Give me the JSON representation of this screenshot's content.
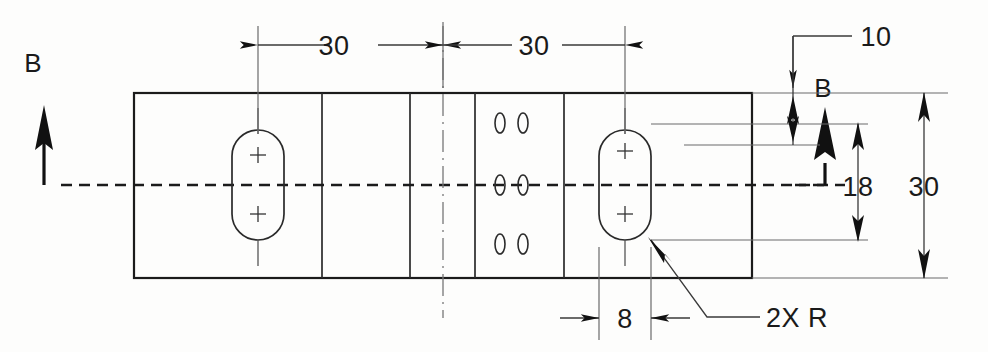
{
  "drawing": {
    "title": "Slotted Plate Section Detail",
    "background_color": "#fdfdfc",
    "line_color": "#1b1b1b",
    "dimensions": {
      "top_left_30": "30",
      "top_right_30": "30",
      "right_10": "10",
      "right_18": "18",
      "right_30": "30",
      "bottom_8": "8",
      "radius_note": "2X R"
    },
    "section_labels": {
      "left": "B",
      "right": "B"
    },
    "geometry": {
      "plate": {
        "x": 134,
        "y": 93,
        "width": 618,
        "height": 185
      },
      "vertical_divisions": [
        322,
        410,
        475,
        564
      ],
      "centerline_y": 185,
      "section_centerline_x": 443,
      "left_slot": {
        "cx": 258,
        "cy": 185,
        "width": 52,
        "height": 110
      },
      "right_slot": {
        "cx": 625,
        "cy": 185,
        "width": 52,
        "height": 110
      },
      "small_ovals_x": [
        500,
        523
      ],
      "small_ovals_y": [
        123,
        185,
        244
      ]
    }
  }
}
